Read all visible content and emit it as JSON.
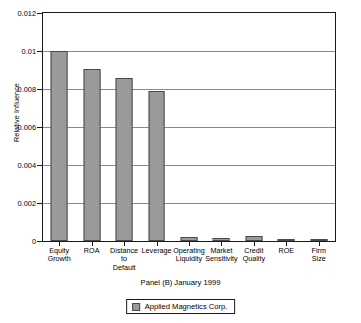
{
  "chart_data": {
    "type": "bar",
    "title": "",
    "subtitle": "",
    "caption": "Panel (B) January 1999",
    "xlabel": "",
    "ylabel": "Relative Influence",
    "ylim": [
      0,
      0.012
    ],
    "ytick_values": [
      0,
      0.002,
      0.004,
      0.006,
      0.008,
      0.01,
      0.012
    ],
    "ytick_labels": [
      "0",
      "0.002",
      "0.004",
      "0.006",
      "0.008",
      "0.01",
      "0.012"
    ],
    "grid": true,
    "legend_position": "bottom",
    "categories": [
      "Equity\nGrowth",
      "ROA",
      "Distance\nto\nDefault",
      "Leverage",
      "Operating\nLiquidity",
      "Market\nSensitivity",
      "Credit\nQuality",
      "ROE",
      "Firm\nSize"
    ],
    "series": [
      {
        "name": "Applied Magnetics Corp.",
        "color": "#9a9a9a",
        "edge_color": "#4a4a4a",
        "values": [
          0.01,
          0.00906,
          0.00858,
          0.00787,
          0.00021,
          0.00018,
          0.00026,
          2e-05,
          1e-05
        ]
      }
    ]
  },
  "legend": {
    "entries": [
      {
        "label": "Applied Magnetics Corp.",
        "color": "#9a9a9a"
      }
    ]
  },
  "axis": {
    "y_title": "Relative Influence"
  }
}
